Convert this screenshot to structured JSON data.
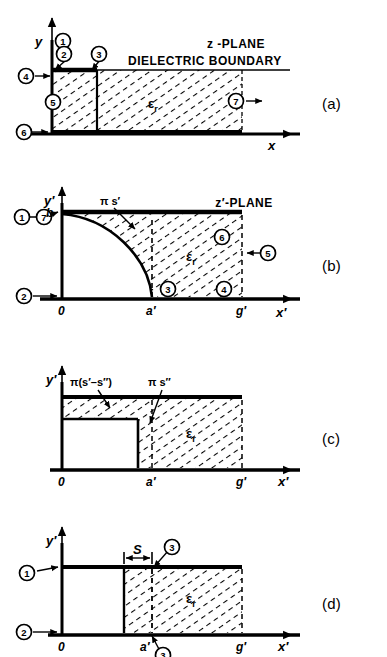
{
  "figure": {
    "type": "conformal-mapping-diagram",
    "panels": [
      {
        "id": "a",
        "letter": "(a)",
        "plane_label": "z -PLANE",
        "boundary_label": "DIELECTRIC  BOUNDARY",
        "dielectric_label": "ε",
        "dielectric_sub": "r",
        "axis_x": "x",
        "axis_y": "y",
        "ticks": {
          "origin": "0"
        },
        "segment_numbers": [
          "1",
          "2",
          "3",
          "4",
          "5",
          "6",
          "7"
        ]
      },
      {
        "id": "b",
        "letter": "(b)",
        "plane_label": "z′-PLANE",
        "curve_label": "π s′",
        "dielectric_label": "ε",
        "dielectric_sub": "r",
        "axis_x": "x′",
        "axis_y": "y′",
        "ticks": {
          "origin": "0",
          "a": "a′",
          "g": "g′",
          "b": "b"
        },
        "segment_numbers": [
          "1",
          "7",
          "2",
          "3",
          "4",
          "5",
          "6"
        ]
      },
      {
        "id": "c",
        "letter": "(c)",
        "label_left": "π(s′–s″)",
        "label_right": "π s″",
        "dielectric_label": "ε",
        "dielectric_sub": "r",
        "axis_x": "x′",
        "axis_y": "y′",
        "ticks": {
          "origin": "0",
          "a": "a′",
          "g": "g′"
        }
      },
      {
        "id": "d",
        "letter": "(d)",
        "dimension_label": "S",
        "dielectric_label": "ε",
        "dielectric_sub": "r",
        "axis_x": "x′",
        "axis_y": "y′",
        "ticks": {
          "origin": "0",
          "a": "a′",
          "g": "g′"
        },
        "segment_numbers": [
          "1",
          "2",
          "3"
        ]
      }
    ],
    "colors": {
      "ink": "#000000",
      "background": "#ffffff"
    }
  }
}
